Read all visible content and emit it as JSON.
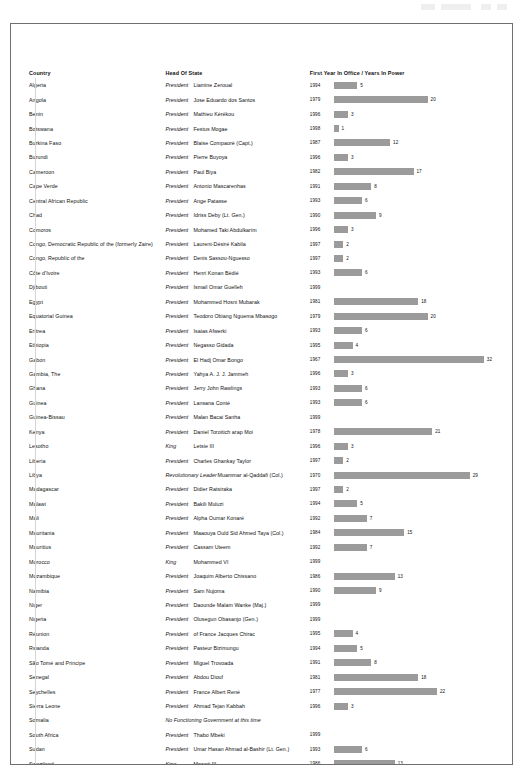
{
  "table": {
    "headers": {
      "country": "Country",
      "head_of_state": "Head Of State",
      "chart": "First Year In Office / Years In Power"
    }
  },
  "chart_data": {
    "type": "bar",
    "title": "First Year In Office / Years In Power",
    "xlabel": "Years In Power",
    "ylabel": "Country",
    "grid": false,
    "legend": false,
    "bar_color": "#9b9b9b",
    "max_value": 32,
    "categories": [
      "Algeria",
      "Angola",
      "Benin",
      "Botswana",
      "Burkina Faso",
      "Burundi",
      "Cameroon",
      "Cape Verde",
      "Central African Republic",
      "Chad",
      "Comoros",
      "Congo, Democratic Republic of the (formerly Zaire)",
      "Congo, Republic of the",
      "Côte d'Ivoire",
      "Djibouti",
      "Egypt",
      "Equatorial Guinea",
      "Eritrea",
      "Ethiopia",
      "Gabon",
      "Gambia, The",
      "Ghana",
      "Guinea",
      "Guinea-Bissau",
      "Kenya",
      "Lesotho",
      "Liberia",
      "Libya",
      "Madagascar",
      "Malawi",
      "Mali",
      "Mauritania",
      "Mauritius",
      "Morocco",
      "Mozambique",
      "Namibia",
      "Niger",
      "Nigeria",
      "Réunion",
      "Rwanda",
      "São Tomé and Principe",
      "Senegal",
      "Seychelles",
      "Sierra Leone",
      "Somalia",
      "South Africa",
      "Sudan",
      "Swaziland",
      "Tanzania",
      "Togo",
      "Tunisia",
      "Uganda",
      "Western Sahara",
      "Zambia",
      "Zimbabwe"
    ],
    "values": [
      5,
      20,
      3,
      1,
      12,
      3,
      17,
      8,
      6,
      9,
      3,
      2,
      2,
      6,
      null,
      18,
      20,
      6,
      4,
      32,
      3,
      6,
      6,
      null,
      21,
      3,
      2,
      29,
      2,
      5,
      7,
      15,
      7,
      null,
      13,
      9,
      null,
      null,
      4,
      5,
      8,
      18,
      22,
      3,
      null,
      null,
      6,
      13,
      4,
      32,
      12,
      13,
      null,
      8,
      12
    ],
    "first_year": [
      1994,
      1979,
      1996,
      1998,
      1987,
      1996,
      1982,
      1991,
      1993,
      1990,
      1996,
      1997,
      1997,
      1993,
      1999,
      1981,
      1979,
      1993,
      1995,
      1967,
      1996,
      1993,
      1993,
      1999,
      1978,
      1996,
      1997,
      1970,
      1997,
      1994,
      1992,
      1984,
      1992,
      1999,
      1986,
      1990,
      1999,
      1999,
      1995,
      1994,
      1991,
      1981,
      1977,
      1996,
      null,
      1999,
      1993,
      1986,
      1995,
      1967,
      1987,
      1986,
      null,
      1991,
      1987
    ]
  },
  "rows": [
    {
      "country": "Algeria",
      "title": "President",
      "title_class": "t-pres",
      "name": "Liamine Zeroual",
      "year": "1994",
      "value": "5"
    },
    {
      "country": "Angola",
      "title": "President",
      "title_class": "t-pres",
      "name": "Jose Eduardo dos Santos",
      "year": "1979",
      "value": "20"
    },
    {
      "country": "Benin",
      "title": "President",
      "title_class": "t-pres",
      "name": "Mathieu Kérékou",
      "year": "1996",
      "value": "3"
    },
    {
      "country": "Botswana",
      "title": "President",
      "title_class": "t-pres",
      "name": "Festus Mogae",
      "year": "1998",
      "value": "1"
    },
    {
      "country": "Burkina Faso",
      "title": "President",
      "title_class": "t-pres",
      "name": "Blaise Compaoré (Capt.)",
      "year": "1987",
      "value": "12"
    },
    {
      "country": "Burundi",
      "title": "President",
      "title_class": "t-pres",
      "name": "Pierre Buyoya",
      "year": "1996",
      "value": "3"
    },
    {
      "country": "Cameroon",
      "title": "President",
      "title_class": "t-pres",
      "name": "Paul Biya",
      "year": "1982",
      "value": "17"
    },
    {
      "country": "Cape Verde",
      "title": "President",
      "title_class": "t-pres",
      "name": "Antonio Mascarenhas",
      "year": "1991",
      "value": "8"
    },
    {
      "country": "Central African Republic",
      "title": "President",
      "title_class": "t-pres",
      "name": "Ange Patasse",
      "year": "1993",
      "value": "6"
    },
    {
      "country": "Chad",
      "title": "President",
      "title_class": "t-pres",
      "name": "Idriss Deby (Lt. Gen.)",
      "year": "1990",
      "value": "9"
    },
    {
      "country": "Comoros",
      "title": "President",
      "title_class": "t-pres",
      "name": "Mohamed Taki Abdulkarim",
      "year": "1996",
      "value": "3"
    },
    {
      "country": "Congo, Democratic Republic of the (formerly Zaire)",
      "title": "President",
      "title_class": "t-pres",
      "name": "Laurent-Désiré Kabila",
      "year": "1997",
      "value": "2"
    },
    {
      "country": "Congo, Republic of the",
      "title": "President",
      "title_class": "t-pres",
      "name": "Denis Sassou-Nguesso",
      "year": "1997",
      "value": "2"
    },
    {
      "country": "Côte d'Ivoire",
      "title": "President",
      "title_class": "t-pres",
      "name": "Henri Konan Bédié",
      "year": "1993",
      "value": "6"
    },
    {
      "country": "Djibouti",
      "title": "President",
      "title_class": "t-pres",
      "name": "Ismail Omar Guelleh",
      "year": "1999",
      "value": ""
    },
    {
      "country": "Egypt",
      "title": "President",
      "title_class": "t-pres",
      "name": "Mohammed Hosni Mubarak",
      "year": "1981",
      "value": "18"
    },
    {
      "country": "Equatorial Guinea",
      "title": "President",
      "title_class": "t-pres",
      "name": "Teodoro Obiang Nguema Mbasogo",
      "year": "1979",
      "value": "20"
    },
    {
      "country": "Eritrea",
      "title": "President",
      "title_class": "t-pres",
      "name": "Isaias Afwerki",
      "year": "1993",
      "value": "6"
    },
    {
      "country": "Ethiopia",
      "title": "President",
      "title_class": "t-pres",
      "name": "Negasso Gidada",
      "year": "1995",
      "value": "4"
    },
    {
      "country": "Gabon",
      "title": "President",
      "title_class": "t-pres",
      "name": "El Hadj Omar Bongo",
      "year": "1967",
      "value": "32"
    },
    {
      "country": "Gambia, The",
      "title": "President",
      "title_class": "t-pres",
      "name": "Yahya A. J. J. Jammeh",
      "year": "1996",
      "value": "3"
    },
    {
      "country": "Ghana",
      "title": "President",
      "title_class": "t-pres",
      "name": "Jerry John Rawlings",
      "year": "1993",
      "value": "6"
    },
    {
      "country": "Guinea",
      "title": "President",
      "title_class": "t-pres",
      "name": "Lansana Conté",
      "year": "1993",
      "value": "6"
    },
    {
      "country": "Guinea-Bissau",
      "title": "President",
      "title_class": "t-pres",
      "name": "Malan Bacai Sanha",
      "year": "1999",
      "value": ""
    },
    {
      "country": "Kenya",
      "title": "President",
      "title_class": "t-pres",
      "name": "Daniel Toroitich arap Moi",
      "year": "1978",
      "value": "21"
    },
    {
      "country": "Lesotho",
      "title": "King",
      "title_class": "t-king",
      "name": "Letsie III",
      "year": "1996",
      "value": "3"
    },
    {
      "country": "Liberia",
      "title": "President",
      "title_class": "t-pres",
      "name": "Charles Ghankay Taylor",
      "year": "1997",
      "value": "2"
    },
    {
      "country": "Libya",
      "title": "Revolutionary Leader",
      "title_class": "t-rev",
      "name": "Muammar al-Qaddafi (Col.)",
      "year": "1970",
      "value": "29"
    },
    {
      "country": "Madagascar",
      "title": "President",
      "title_class": "t-pres",
      "name": "Didier Ratsiraka",
      "year": "1997",
      "value": "2"
    },
    {
      "country": "Malawi",
      "title": "President",
      "title_class": "t-pres",
      "name": "Bakili Muluzi",
      "year": "1994",
      "value": "5"
    },
    {
      "country": "Mali",
      "title": "President",
      "title_class": "t-pres",
      "name": "Alpha Oumar Konaré",
      "year": "1992",
      "value": "7"
    },
    {
      "country": "Mauritania",
      "title": "President",
      "title_class": "t-pres",
      "name": "Maaouya Ould Sid Ahmed Taya (Col.)",
      "year": "1984",
      "value": "15"
    },
    {
      "country": "Mauritius",
      "title": "President",
      "title_class": "t-pres",
      "name": "Cassam Uteem",
      "year": "1992",
      "value": "7"
    },
    {
      "country": "Morocco",
      "title": "King",
      "title_class": "t-king",
      "name": "Mohammed VI",
      "year": "1999",
      "value": ""
    },
    {
      "country": "Mozambique",
      "title": "President",
      "title_class": "t-pres",
      "name": "Joaquim Alberto Chissano",
      "year": "1986",
      "value": "13"
    },
    {
      "country": "Namibia",
      "title": "President",
      "title_class": "t-pres",
      "name": "Sam Nujoma",
      "year": "1990",
      "value": "9"
    },
    {
      "country": "Niger",
      "title": "President",
      "title_class": "t-pres",
      "name": "Daounde Malam Wanke (Maj.)",
      "year": "1999",
      "value": ""
    },
    {
      "country": "Nigeria",
      "title": "President",
      "title_class": "t-pres",
      "name": "Olusegun Obasanjo (Gen.)",
      "year": "1999",
      "value": ""
    },
    {
      "country": "Réunion",
      "title": "President",
      "title_class": "t-pres",
      "name": "of France Jacques Chirac",
      "year": "1995",
      "value": "4"
    },
    {
      "country": "Rwanda",
      "title": "President",
      "title_class": "t-pres",
      "name": "Pasteur Bizimungu",
      "year": "1994",
      "value": "5"
    },
    {
      "country": "São Tomé and Principe",
      "title": "President",
      "title_class": "t-pres",
      "name": "Miguel Trovoada",
      "year": "1991",
      "value": "8"
    },
    {
      "country": "Senegal",
      "title": "President",
      "title_class": "t-pres",
      "name": "Abdou Diouf",
      "year": "1981",
      "value": "18"
    },
    {
      "country": "Seychelles",
      "title": "President",
      "title_class": "t-pres",
      "name": "France Albert René",
      "year": "1977",
      "value": "22"
    },
    {
      "country": "Sierra Leone",
      "title": "President",
      "title_class": "t-pres",
      "name": "Ahmad Tejan Kabbah",
      "year": "1996",
      "value": "3"
    },
    {
      "country": "Somalia",
      "title": "No Functioning Government at this time",
      "title_class": "t-note",
      "name": "",
      "year": "",
      "value": ""
    },
    {
      "country": "South Africa",
      "title": "President",
      "title_class": "t-pres",
      "name": "Thabo Mbeki",
      "year": "1999",
      "value": ""
    },
    {
      "country": "Sudan",
      "title": "President",
      "title_class": "t-pres",
      "name": "Umar Hasan Ahmad al-Bashir (Lt. Gen.)",
      "year": "1993",
      "value": "6"
    },
    {
      "country": "Swaziland",
      "title": "King",
      "title_class": "t-king",
      "name": "Mswati III",
      "year": "1986",
      "value": "13"
    },
    {
      "country": "Tanzania",
      "title": "President",
      "title_class": "t-pres",
      "name": "Benjamin William Mkapa",
      "year": "1995",
      "value": "4"
    },
    {
      "country": "Togo",
      "title": "President",
      "title_class": "t-pres",
      "name": "Gnassingbé Eyadéma (Gen.)",
      "year": "1967",
      "value": "32"
    },
    {
      "country": "Tunisia",
      "title": "President",
      "title_class": "t-pres",
      "name": "Zine El Abidine Ben Ali",
      "year": "1987",
      "value": "12"
    },
    {
      "country": "Uganda",
      "title": "President",
      "title_class": "t-pres",
      "name": "Yoweri Kaguta Museveni (Lt. Gen.)",
      "year": "1986",
      "value": "13"
    },
    {
      "country": "Western Sahara",
      "title": "Disputed Territory",
      "title_class": "t-note",
      "name": "",
      "year": "",
      "value": ""
    },
    {
      "country": "Zambia",
      "title": "President",
      "title_class": "t-pres",
      "name": "Frederick Chiluba",
      "year": "1991",
      "value": "8"
    },
    {
      "country": "Zimbabwe",
      "title": "President",
      "title_class": "t-pres",
      "name": "Robert Gabriel Mugabe",
      "year": "1987",
      "value": "12"
    }
  ]
}
